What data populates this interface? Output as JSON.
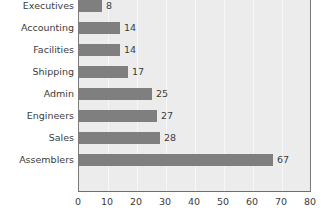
{
  "chart_data": {
    "type": "bar",
    "orientation": "horizontal",
    "title": "",
    "subtitle": "",
    "xlabel": "",
    "ylabel": "",
    "categories": [
      "Executives",
      "Accounting",
      "Facilities",
      "Shipping",
      "Admin",
      "Engineers",
      "Sales",
      "Assemblers"
    ],
    "values": [
      8,
      14,
      14,
      17,
      25,
      27,
      28,
      67
    ],
    "value_labels": [
      "8",
      "14",
      "14",
      "17",
      "25",
      "27",
      "28",
      "67"
    ],
    "xlim": [
      0,
      80
    ],
    "xticks": [
      0,
      10,
      20,
      30,
      40,
      50,
      60,
      70,
      80
    ],
    "xtick_labels": [
      "0",
      "10",
      "20",
      "30",
      "40",
      "50",
      "60",
      "70",
      "80"
    ],
    "grid": "vertical",
    "legend": "none",
    "bar_color": "#7f7f7f",
    "plot_background": "#ececec",
    "gridline_color": "#f7f7f7",
    "axis_color": "#6f6f6f",
    "text_color": "#3c3c3c"
  }
}
